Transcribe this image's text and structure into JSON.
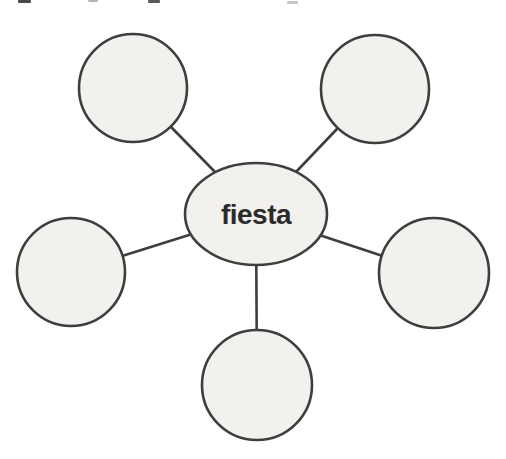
{
  "diagram": {
    "type": "word-web",
    "center_node": {
      "id": "center-node",
      "label": "fiesta",
      "shape": "ellipse",
      "cx": 256,
      "cy": 214,
      "rx": 71,
      "ry": 51
    },
    "satellite_nodes": [
      {
        "id": "node-top-left",
        "label": "",
        "shape": "circle",
        "cx": 133,
        "cy": 88,
        "r": 54
      },
      {
        "id": "node-top-right",
        "label": "",
        "shape": "circle",
        "cx": 375,
        "cy": 89,
        "r": 54
      },
      {
        "id": "node-left",
        "label": "",
        "shape": "circle",
        "cx": 71,
        "cy": 272,
        "r": 54
      },
      {
        "id": "node-right",
        "label": "",
        "shape": "circle",
        "cx": 434,
        "cy": 273,
        "r": 55
      },
      {
        "id": "node-bottom",
        "label": "",
        "shape": "circle",
        "cx": 257,
        "cy": 385,
        "r": 55
      }
    ],
    "colors": {
      "node_fill": "#f2f1ee",
      "node_stroke": "#3e3e3e",
      "connector": "#3e3e3e",
      "label_text": "#2b2b2b",
      "background": "#ffffff"
    },
    "stroke_width": 2.6,
    "scan_artifacts": [
      {
        "x": 18,
        "y": 0,
        "w": 13,
        "h": 3,
        "color": "#4a4a4a"
      },
      {
        "x": 88,
        "y": 0,
        "w": 10,
        "h": 2,
        "color": "#b5b5b5"
      },
      {
        "x": 148,
        "y": 0,
        "w": 12,
        "h": 3,
        "color": "#5a5a5a"
      },
      {
        "x": 287,
        "y": 1,
        "w": 11,
        "h": 3,
        "color": "#c6c6c6"
      }
    ]
  }
}
